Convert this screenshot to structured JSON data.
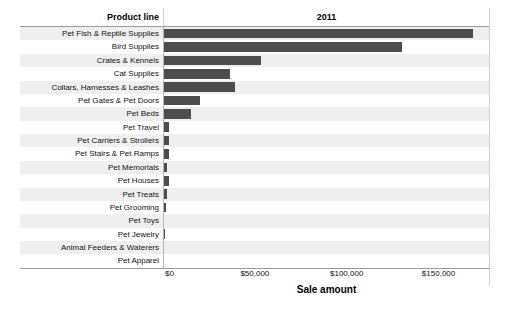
{
  "header": {
    "product_line_label": "Product line",
    "year_label": "2011"
  },
  "axis": {
    "title": "Sale amount",
    "ticks": [
      "$0",
      "$50,000",
      "$100,000",
      "$150,000"
    ],
    "tick_values": [
      0,
      50000,
      100000,
      150000
    ]
  },
  "colors": {
    "bar": "#4d4d4d",
    "row_stripe": "#efefef",
    "row_base": "#ffffff",
    "rule": "#9a9a9a"
  },
  "chart_data": {
    "type": "bar",
    "orientation": "horizontal",
    "title": "2011",
    "xlabel": "Sale amount",
    "ylabel": "Product line",
    "xlim": [
      0,
      178000
    ],
    "grid": false,
    "legend": null,
    "categories": [
      "Pet Fish & Reptile Supplies",
      "Bird Supplies",
      "Crates & Kennels",
      "Cat Supplies",
      "Collars, Harnesses & Leashes",
      "Pet Gates & Pet Doors",
      "Pet Beds",
      "Pet Travel",
      "Pet Carriers & Strollers",
      "Pet Stairs & Pet Ramps",
      "Pet Memorials",
      "Pet Houses",
      "Pet Treats",
      "Pet Grooming",
      "Pet Toys",
      "Pet Jewelry",
      "Animal Feeders & Waterers",
      "Pet Apparel"
    ],
    "values": [
      168500,
      130000,
      53500,
      36500,
      39000,
      20000,
      15000,
      3000,
      3000,
      3000,
      2200,
      3000,
      2000,
      1500,
      700,
      900,
      600,
      600
    ]
  }
}
